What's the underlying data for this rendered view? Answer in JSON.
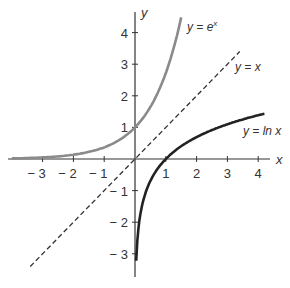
{
  "chart_data": {
    "type": "line",
    "title": "",
    "xlabel": "x",
    "ylabel": "y",
    "xlim": [
      -4.1,
      4.4
    ],
    "ylim": [
      -3.8,
      4.7
    ],
    "grid": false,
    "x_ticks": [
      -3,
      -2,
      -1,
      1,
      2,
      3,
      4
    ],
    "y_ticks": [
      -3,
      -2,
      -1,
      1,
      2,
      3,
      4
    ],
    "series": [
      {
        "name": "y = e^x",
        "label": "y = e",
        "label_sup": "x",
        "color": "#8a8a8a",
        "style": "solid",
        "x": [
          -4.0,
          -3.0,
          -2.0,
          -1.0,
          0.0,
          0.5,
          1.0,
          1.3,
          1.5
        ],
        "y": [
          0.018,
          0.05,
          0.135,
          0.368,
          1.0,
          1.649,
          2.718,
          3.669,
          4.482
        ]
      },
      {
        "name": "y = x",
        "label": "y = x",
        "color": "#333333",
        "style": "dashed",
        "x": [
          -3.4,
          3.4
        ],
        "y": [
          -3.4,
          3.4
        ]
      },
      {
        "name": "y = ln x",
        "label": "y = ln x",
        "color": "#222222",
        "style": "solid",
        "x": [
          0.04,
          0.1,
          0.25,
          0.5,
          1.0,
          2.0,
          3.0,
          4.2
        ],
        "y": [
          -3.22,
          -2.3,
          -1.39,
          -0.69,
          0.0,
          0.69,
          1.1,
          1.44
        ]
      }
    ]
  },
  "axes": {
    "x_label": "x",
    "y_label": "y",
    "x_tick_labels": [
      "− 3",
      "− 2",
      "− 1",
      "1",
      "2",
      "3",
      "4"
    ],
    "y_tick_labels_pos": [
      "1",
      "2",
      "3",
      "4"
    ],
    "y_tick_labels_neg": [
      "− 1",
      "− 2",
      "− 3"
    ]
  },
  "labels": {
    "exp": "y = e",
    "exp_sup": "x",
    "identity": "y = x",
    "log": "y = ln x"
  }
}
